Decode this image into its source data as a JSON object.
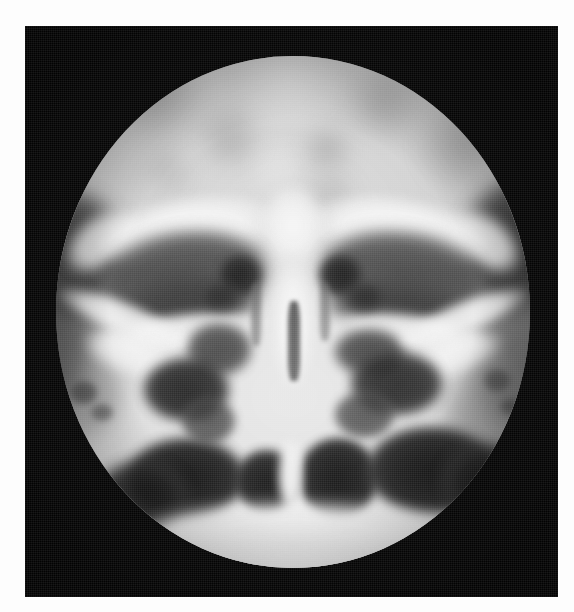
{
  "page": {
    "background_color": "#fdfdfd",
    "width": 574,
    "height": 612
  },
  "plate": {
    "label": "radiographic-film-plate",
    "background_color": "#060606",
    "x": 25,
    "y": 26,
    "width": 533,
    "height": 571
  },
  "radiograph": {
    "modality": "plain-film-radiograph",
    "view": "occipitomental / Waters projection of the paranasal sinuses",
    "collimation": "circular cone",
    "field": {
      "cx": 268,
      "cy": 286,
      "rx": 237,
      "ry": 256
    },
    "tone": {
      "film_black": "#060606",
      "air_black": "#121212",
      "soft_tissue_gray": "#9d9d9d",
      "cranial_vault_gray": "#cfcfcf",
      "bone_white": "#f6f6f6",
      "highlight_white": "#fbfbfb"
    },
    "anatomy": [
      {
        "name": "cranial-vault",
        "density": "moderately radiolucent grey, mottled"
      },
      {
        "name": "frontal-sinus-region",
        "density": "grey, faintly lucent"
      },
      {
        "name": "superior-orbital-rim-left",
        "density": "bright cortical arc"
      },
      {
        "name": "superior-orbital-rim-right",
        "density": "bright cortical arc"
      },
      {
        "name": "orbit-left",
        "density": "dark grey orbital cavity"
      },
      {
        "name": "orbit-right",
        "density": "dark grey orbital cavity"
      },
      {
        "name": "ethmoid-air-cells",
        "density": "clustered dark lucencies midline"
      },
      {
        "name": "nasal-septum",
        "density": "bright vertical midline bone"
      },
      {
        "name": "nasal-cavity-left",
        "density": "black air lucency"
      },
      {
        "name": "nasal-cavity-right",
        "density": "black air lucency"
      },
      {
        "name": "maxillary-sinus-left",
        "density": "black air lucency"
      },
      {
        "name": "maxillary-sinus-right",
        "density": "black air lucency"
      },
      {
        "name": "zygomatic-arch-left",
        "density": "bright oblique cortical line"
      },
      {
        "name": "zygomatic-arch-right",
        "density": "bright oblique cortical line"
      },
      {
        "name": "petrous-ridge-left",
        "density": "dark band at lateral margin"
      },
      {
        "name": "petrous-ridge-right",
        "density": "dark band at lateral margin"
      },
      {
        "name": "hard-palate",
        "density": "bright horizontal band inferiorly"
      }
    ]
  }
}
